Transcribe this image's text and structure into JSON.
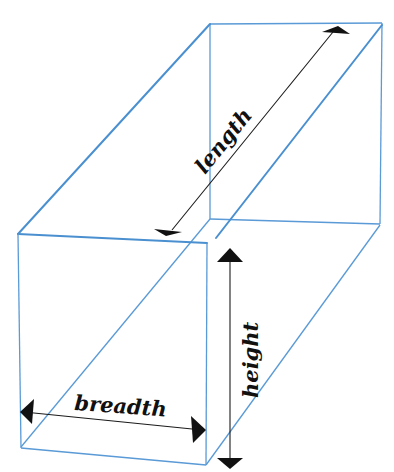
{
  "diagram": {
    "type": "cuboid-dimensions",
    "labels": {
      "length": "length",
      "breadth": "breadth",
      "height": "height"
    },
    "colors": {
      "edges": "#4a90d0",
      "arrows": "#111111",
      "background": "#ffffff"
    }
  }
}
